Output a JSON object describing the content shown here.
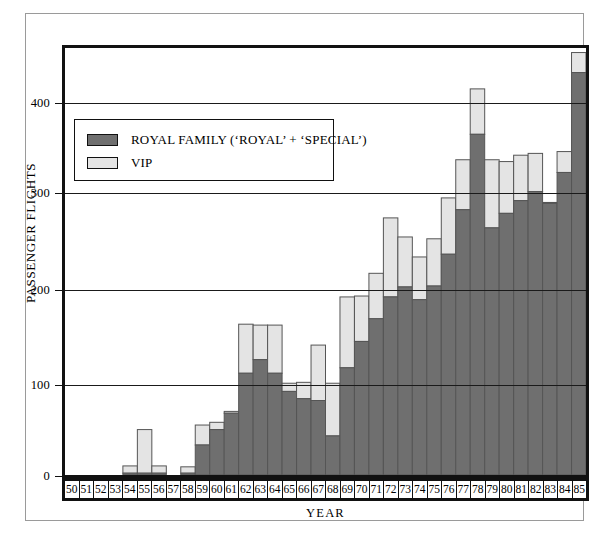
{
  "chart_data": {
    "type": "bar",
    "stacked": true,
    "title": "",
    "xlabel": "YEAR",
    "ylabel": "PASSENGER FLIGHTS",
    "ylim": [
      0,
      470
    ],
    "yticks": [
      0,
      100,
      200,
      300,
      400
    ],
    "grid": "horizontal-at-yticks",
    "legend_position": "upper-left-inside",
    "categories": [
      "50",
      "51",
      "52",
      "53",
      "54",
      "55",
      "56",
      "57",
      "58",
      "59",
      "60",
      "61",
      "62",
      "63",
      "64",
      "65",
      "66",
      "67",
      "68",
      "69",
      "70",
      "71",
      "72",
      "73",
      "74",
      "75",
      "76",
      "77",
      "78",
      "79",
      "80",
      "81",
      "82",
      "83",
      "84",
      "85"
    ],
    "series": [
      {
        "name": "ROYAL FAMILY ('ROYAL' + 'SPECIAL')",
        "color": "#6f6f6f",
        "values": [
          0,
          0,
          0,
          0,
          2,
          2,
          2,
          0,
          2,
          33,
          50,
          68,
          112,
          127,
          112,
          92,
          84,
          82,
          43,
          118,
          147,
          172,
          196,
          207,
          193,
          208,
          243,
          292,
          375,
          272,
          288,
          302,
          312,
          299,
          333,
          443
        ]
      },
      {
        "name": "VIP",
        "color": "#e4e4e4",
        "values": [
          0,
          0,
          0,
          0,
          8,
          48,
          8,
          0,
          7,
          22,
          8,
          2,
          54,
          38,
          53,
          9,
          18,
          61,
          58,
          78,
          50,
          50,
          87,
          55,
          47,
          52,
          62,
          55,
          50,
          75,
          57,
          50,
          42,
          1,
          23,
          22
        ]
      }
    ],
    "totals": [
      0,
      0,
      0,
      0,
      10,
      50,
      10,
      0,
      9,
      55,
      58,
      70,
      166,
      165,
      165,
      101,
      102,
      143,
      101,
      196,
      197,
      222,
      283,
      262,
      240,
      260,
      305,
      347,
      425,
      347,
      345,
      352,
      354,
      300,
      356,
      465
    ]
  },
  "legend": {
    "items": [
      {
        "label": "ROYAL FAMILY (‘ROYAL’ + ‘SPECIAL’)"
      },
      {
        "label": "VIP"
      }
    ]
  },
  "axes": {
    "y_title": "PASSENGER FLIGHTS",
    "x_title": "YEAR",
    "y_tick_labels": [
      "400",
      "300",
      "200",
      "100",
      "0"
    ]
  }
}
